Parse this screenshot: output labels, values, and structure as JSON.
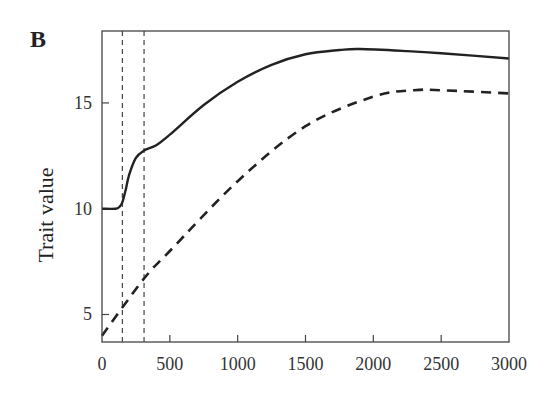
{
  "chart_data": {
    "type": "line",
    "panel_label": "B",
    "title": "",
    "xlabel": "",
    "ylabel": "Trait value",
    "xlim": [
      0,
      3000
    ],
    "ylim": [
      3.7,
      18.4
    ],
    "xticks": [
      0,
      500,
      1000,
      1500,
      2000,
      2500,
      3000
    ],
    "yticks": [
      5,
      10,
      15
    ],
    "grid": false,
    "legend": null,
    "vertical_reference_lines": [
      150,
      310
    ],
    "series": [
      {
        "name": "solid",
        "style": "solid",
        "x": [
          0,
          100,
          130,
          150,
          175,
          200,
          250,
          310,
          400,
          500,
          750,
          1000,
          1250,
          1500,
          1750,
          1900,
          2250,
          2500,
          3000
        ],
        "y": [
          10,
          10,
          10.1,
          10.3,
          10.9,
          11.6,
          12.4,
          12.75,
          13.0,
          13.5,
          14.9,
          16.0,
          16.8,
          17.3,
          17.5,
          17.55,
          17.45,
          17.35,
          17.1
        ]
      },
      {
        "name": "dashed",
        "style": "dashed",
        "x": [
          0,
          310,
          500,
          1000,
          1500,
          2000,
          2300,
          2500,
          3000
        ],
        "y": [
          4.0,
          6.7,
          8.0,
          11.3,
          13.9,
          15.3,
          15.6,
          15.6,
          15.45
        ]
      }
    ]
  }
}
